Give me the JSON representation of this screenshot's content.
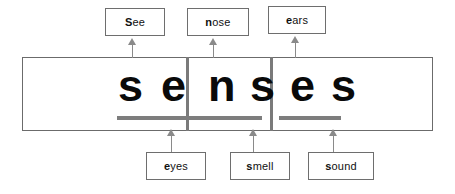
{
  "diagram": {
    "word": "senses",
    "colors": {
      "frame_border": "#6b6b6b",
      "divider": "#7a7a7a",
      "letter": "#0a0a0a",
      "blank_line": "#7d7d7d",
      "arrow": "#8a8a8a",
      "label_border": "#6e6e6e",
      "background": "#ffffff"
    },
    "letters": [
      {
        "char": "s",
        "x": 96
      },
      {
        "char": "e",
        "x": 139
      },
      {
        "char": "n",
        "x": 186
      },
      {
        "char": "s",
        "x": 228
      },
      {
        "char": "e",
        "x": 268
      },
      {
        "char": "s",
        "x": 309
      }
    ],
    "cells": [
      {
        "name": "cell-1",
        "blank_x": 117,
        "blank_width": 85
      },
      {
        "name": "cell-2",
        "blank_x": 200,
        "blank_width": 62
      },
      {
        "name": "cell-3",
        "blank_x": 279,
        "blank_width": 62
      }
    ],
    "dividers": [
      {
        "name": "divider-1",
        "x": 186
      },
      {
        "name": "divider-2",
        "x": 270
      }
    ],
    "top_labels": [
      {
        "id": "see",
        "bold": "S",
        "rest": "ee",
        "x": 105,
        "y": 8,
        "w": 60,
        "h": 28,
        "arrow_x": 128,
        "arrow_y": 38,
        "arrow_h": 20
      },
      {
        "id": "nose",
        "bold": "n",
        "rest": "ose",
        "x": 187,
        "y": 8,
        "w": 62,
        "h": 28,
        "arrow_x": 209,
        "arrow_y": 38,
        "arrow_h": 20
      },
      {
        "id": "ears",
        "bold": "e",
        "rest": "ars",
        "x": 268,
        "y": 6,
        "w": 58,
        "h": 28,
        "arrow_x": 291,
        "arrow_y": 36,
        "arrow_h": 22
      }
    ],
    "bottom_labels": [
      {
        "id": "eyes",
        "bold": "e",
        "rest": "yes",
        "x": 146,
        "y": 152,
        "w": 60,
        "h": 28,
        "arrow_x": 167,
        "arrow_y": 129,
        "arrow_h": 23
      },
      {
        "id": "smell",
        "bold": "s",
        "rest": "mell",
        "x": 230,
        "y": 152,
        "w": 60,
        "h": 28,
        "arrow_x": 249,
        "arrow_y": 129,
        "arrow_h": 23
      },
      {
        "id": "sound",
        "bold": "s",
        "rest": "ound",
        "x": 308,
        "y": 152,
        "w": 66,
        "h": 28,
        "arrow_x": 329,
        "arrow_y": 129,
        "arrow_h": 23
      }
    ]
  }
}
